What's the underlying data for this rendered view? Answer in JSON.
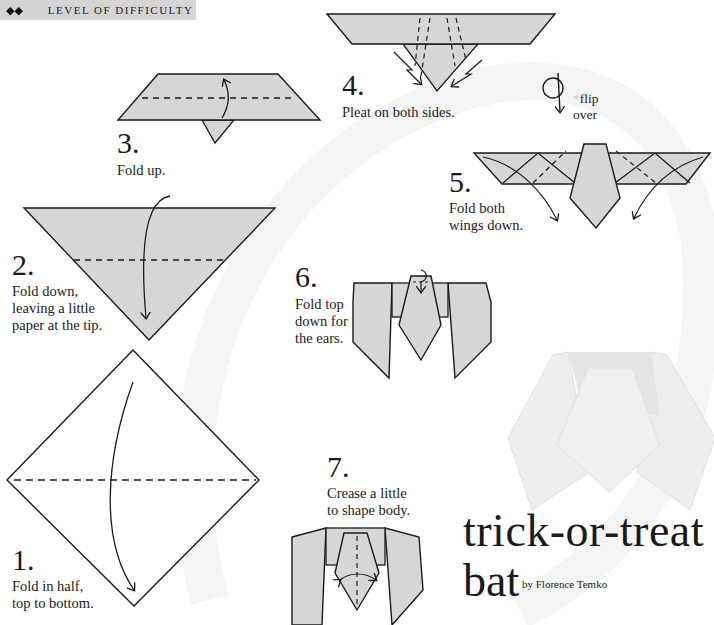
{
  "header": {
    "difficulty_filled": "◆◆",
    "difficulty_empty": "◇◇",
    "difficulty_label": "LEVEL OF DIFFICULTY"
  },
  "title": {
    "line1": "trick-or-treat",
    "line2": "bat",
    "byline": "by Florence Temko"
  },
  "steps": [
    {
      "number": "1.",
      "text_lines": [
        "Fold in half,",
        "top to bottom."
      ]
    },
    {
      "number": "2.",
      "text_lines": [
        "Fold down,",
        "leaving a little",
        "paper at the tip."
      ]
    },
    {
      "number": "3.",
      "text_lines": [
        "Fold up."
      ]
    },
    {
      "number": "4.",
      "text_lines": [
        "Pleat on both sides."
      ]
    },
    {
      "number": "5.",
      "text_lines": [
        "Fold both",
        "wings down."
      ]
    },
    {
      "number": "6.",
      "text_lines": [
        "Fold top",
        "down for",
        "the ears."
      ]
    },
    {
      "number": "7.",
      "text_lines": [
        "Crease a little",
        "to shape body."
      ]
    }
  ],
  "flip_note": {
    "asterisk": "*",
    "line1": "flip",
    "line2": "over"
  },
  "colors": {
    "paper_fill": "#d6d6d6",
    "line": "#1a1a1a",
    "badge_bg": "#d4d4d4",
    "watermark": "#f3f3f3"
  }
}
